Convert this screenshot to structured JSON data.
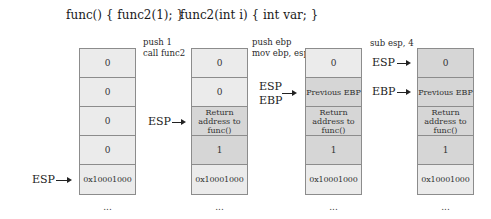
{
  "code": {
    "caller": "func() { func2(1); }",
    "callee": "func2(int i) { int var; }"
  },
  "stages": [
    {
      "instructions": [],
      "cells": [
        {
          "label": "0",
          "shade": "light"
        },
        {
          "label": "0",
          "shade": "light"
        },
        {
          "label": "0",
          "shade": "light"
        },
        {
          "label": "0",
          "shade": "light"
        },
        {
          "label": "0x10001000",
          "shade": "light"
        }
      ],
      "pointers": [
        {
          "name": "ESP",
          "cell_index": 4
        }
      ],
      "ellipsis": "..."
    },
    {
      "instructions": [
        "push 1",
        "call func2"
      ],
      "cells": [
        {
          "label": "0",
          "shade": "light"
        },
        {
          "label": "0",
          "shade": "light"
        },
        {
          "label": "Return address to func()",
          "shade": "dark"
        },
        {
          "label": "1",
          "shade": "dark"
        },
        {
          "label": "0x10001000",
          "shade": "light"
        }
      ],
      "pointers": [
        {
          "name": "ESP",
          "cell_index": 2
        }
      ],
      "ellipsis": "..."
    },
    {
      "instructions": [
        "push ebp",
        "mov ebp, esp"
      ],
      "cells": [
        {
          "label": "0",
          "shade": "light"
        },
        {
          "label": "Previous EBP",
          "shade": "dark"
        },
        {
          "label": "Return address to func()",
          "shade": "dark"
        },
        {
          "label": "1",
          "shade": "dark"
        },
        {
          "label": "0x10001000",
          "shade": "light"
        }
      ],
      "pointers": [
        {
          "name": "ESP",
          "cell_index": 1
        },
        {
          "name": "EBP",
          "cell_index": 1
        }
      ],
      "ellipsis": "..."
    },
    {
      "instructions": [
        "sub esp, 4"
      ],
      "cells": [
        {
          "label": "0",
          "shade": "dark"
        },
        {
          "label": "Previous EBP",
          "shade": "dark"
        },
        {
          "label": "Return address to func()",
          "shade": "dark"
        },
        {
          "label": "1",
          "shade": "dark"
        },
        {
          "label": "0x10001000",
          "shade": "light"
        }
      ],
      "pointers": [
        {
          "name": "ESP",
          "cell_index": 0
        },
        {
          "name": "EBP",
          "cell_index": 1
        }
      ],
      "ellipsis": "..."
    }
  ]
}
